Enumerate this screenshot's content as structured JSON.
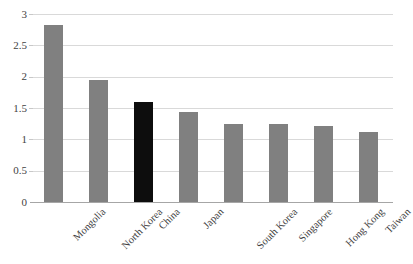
{
  "chart_data": {
    "type": "bar",
    "title": "",
    "subtitle": "",
    "xlabel": "",
    "ylabel": "",
    "categories": [
      "Mongolia",
      "North Korea",
      "China",
      "Japan",
      "South Korea",
      "Singapore",
      "Hong Kong",
      "Taiwan"
    ],
    "values": [
      2.83,
      1.95,
      1.6,
      1.43,
      1.24,
      1.24,
      1.22,
      1.12
    ],
    "highlight_category": "China",
    "ylim": [
      0,
      3
    ],
    "ytick_labels": [
      "3",
      "2.5",
      "2",
      "1.5",
      "1",
      "0.5",
      "0"
    ],
    "ytick_values": [
      3,
      2.5,
      2,
      1.5,
      1,
      0.5,
      0
    ],
    "grid": true,
    "legend": "none",
    "bar_colors": {
      "default": "#808080",
      "highlight": "#0d0d0d"
    },
    "axis_color": "#a6a6a6",
    "gridline_color": "#d9d9d9",
    "text_color": "#3f3f3f",
    "background": "#ffffff"
  }
}
